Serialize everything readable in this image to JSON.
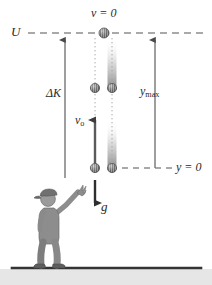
{
  "figure": {
    "background_color": "#ffffff",
    "ground_color": "#3a3a3a",
    "ball_color": "#8c8c8c",
    "arrow_color": "#4a4a4a",
    "person_color": "#9a9a9a",
    "labels": {
      "potential_energy": "U",
      "velocity_zero": "v = 0",
      "delta_kinetic": "ΔK",
      "max_height": "y",
      "max_height_sub": "max",
      "initial_velocity": "v",
      "initial_velocity_sub": "o",
      "origin": "y = 0",
      "gravity": "g"
    },
    "geometry": {
      "u_line_y": 33,
      "y0_line_y": 168,
      "ground_y": 268,
      "up_path_x": 95,
      "down_path_x": 112,
      "delta_k_x": 65,
      "ymax_x": 155,
      "ball_radius": 4.5,
      "ball_positions_up": [
        33,
        88,
        168
      ],
      "ball_positions_down": [
        33,
        88,
        168
      ]
    }
  }
}
